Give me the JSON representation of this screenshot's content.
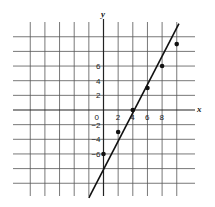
{
  "chart_data": {
    "type": "line",
    "title": "",
    "xlabel": "x",
    "ylabel": "y",
    "xlim": [
      -12,
      10
    ],
    "ylim": [
      -12,
      12
    ],
    "grid": true,
    "grid_step": 2,
    "x_tick_labels": [
      "0",
      "2",
      "4",
      "6",
      "8"
    ],
    "x_tick_values": [
      0,
      2,
      4,
      6,
      8
    ],
    "y_tick_labels": [
      "6",
      "4",
      "2",
      "-2",
      "-4",
      "-6"
    ],
    "y_tick_values": [
      6,
      4,
      2,
      -2,
      -4,
      -6
    ],
    "series": [
      {
        "name": "line",
        "equation": "y = 1.5x - 6",
        "points": [
          {
            "x": 0,
            "y": -6
          },
          {
            "x": 2,
            "y": -3
          },
          {
            "x": 4,
            "y": 0
          },
          {
            "x": 6,
            "y": 3
          },
          {
            "x": 8,
            "y": 6
          },
          {
            "x": 10,
            "y": 9
          }
        ],
        "line_start": {
          "x": -2,
          "y": -12
        },
        "line_end": {
          "x": 10.3,
          "y": 11.8
        }
      }
    ],
    "legend": null
  },
  "colors": {
    "grid": "#555555",
    "axis": "#222222",
    "line": "#111111",
    "point": "#111111",
    "background": "#ffffff"
  }
}
